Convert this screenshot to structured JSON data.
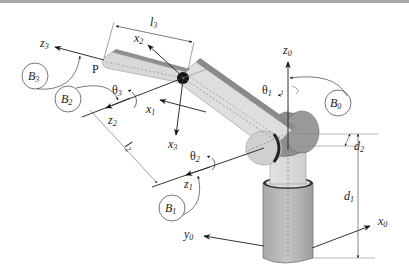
{
  "figure": {
    "type": "robot-arm-kinematic-diagram"
  },
  "frames": [
    {
      "id": "B0",
      "label": "B",
      "sub": "0"
    },
    {
      "id": "B1",
      "label": "B",
      "sub": "1"
    },
    {
      "id": "B2",
      "label": "B",
      "sub": "2"
    },
    {
      "id": "B3",
      "label": "B",
      "sub": "3"
    }
  ],
  "axes": {
    "x0": {
      "label": "x",
      "sub": "0"
    },
    "y0": {
      "label": "y",
      "sub": "0"
    },
    "z0": {
      "label": "z",
      "sub": "0"
    },
    "x1": {
      "label": "x",
      "sub": "1"
    },
    "z1": {
      "label": "z",
      "sub": "1"
    },
    "x2": {
      "label": "x",
      "sub": "2"
    },
    "z2": {
      "label": "z",
      "sub": "2"
    },
    "x3": {
      "label": "x",
      "sub": "3"
    },
    "z3": {
      "label": "z",
      "sub": "3"
    }
  },
  "joints": {
    "theta1": {
      "label": "θ",
      "sub": "1"
    },
    "theta2": {
      "label": "θ",
      "sub": "2"
    },
    "theta3": {
      "label": "θ",
      "sub": "3"
    }
  },
  "dimensions": {
    "d1": {
      "label": "d",
      "sub": "1"
    },
    "d2": {
      "label": "d",
      "sub": "2"
    },
    "l2": {
      "label": "l",
      "sub": "2"
    },
    "l3": {
      "label": "l",
      "sub": "3"
    }
  },
  "points": {
    "P": "P"
  },
  "colors": {
    "link_light": "#d9d9d9",
    "link_dark": "#8c8c8c",
    "base": "#b0b0b0",
    "line": "#222222",
    "dim_line": "#555555"
  }
}
